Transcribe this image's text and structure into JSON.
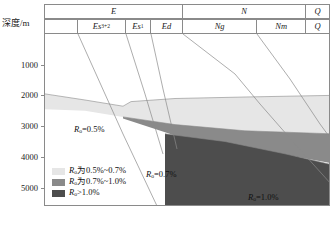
{
  "axis": {
    "depth_label": "深度/m",
    "ticks": [
      {
        "label": "1000",
        "depth": 1000
      },
      {
        "label": "2000",
        "depth": 2000
      },
      {
        "label": "3000",
        "depth": 3000
      },
      {
        "label": "4000",
        "depth": 4000
      },
      {
        "label": "5000",
        "depth": 5000
      }
    ],
    "unit": "m",
    "range": [
      0,
      5600
    ]
  },
  "stratigraphy": {
    "system_row": [
      {
        "label": "E",
        "width_pct": 48.3
      },
      {
        "label": "N",
        "width_pct": 43.0
      },
      {
        "label": "Q",
        "width_pct": 8.7
      }
    ],
    "formation_row": [
      {
        "label": "",
        "sub": "",
        "width_pct": 11.5
      },
      {
        "label": "Es",
        "sub": "3+2",
        "width_pct": 16.8
      },
      {
        "label": "Es",
        "sub": "1",
        "width_pct": 8.7
      },
      {
        "label": "Ed",
        "sub": "",
        "width_pct": 11.3
      },
      {
        "label": "Ng",
        "sub": "",
        "width_pct": 25.9
      },
      {
        "label": "Nm",
        "sub": "",
        "width_pct": 17.1
      },
      {
        "label": "Q",
        "sub": "",
        "width_pct": 8.7
      }
    ]
  },
  "legend": {
    "items": [
      {
        "swatch_color": "#e6e6e6",
        "symbol": "R",
        "sub": "o",
        "text": "为0.5%~0.7%"
      },
      {
        "swatch_color": "#8a8a8a",
        "symbol": "R",
        "sub": "o",
        "text": "为0.7%~1.0%"
      },
      {
        "swatch_color": "#4d4d4d",
        "symbol": "R",
        "sub": "o",
        "text": ">1.0%"
      }
    ]
  },
  "annotations": [
    {
      "id": "ro-05",
      "symbol": "R",
      "sub": "o",
      "text": "=0.5%",
      "x": 74,
      "y": 125
    },
    {
      "id": "ro-07",
      "symbol": "R",
      "sub": "o",
      "text": "=0.7%",
      "x": 146,
      "y": 170
    },
    {
      "id": "ro-10",
      "symbol": "R",
      "sub": "o",
      "text": "=1.0%",
      "x": 248,
      "y": 193
    }
  ],
  "caption": {
    "text": ""
  },
  "colors": {
    "band_low": "#e6e6e6",
    "band_mid": "#8a8a8a",
    "band_high": "#4d4d4d",
    "line": "#8a8a8a",
    "frame": "#8a8a8a",
    "text": "#111111",
    "background": "#ffffff"
  },
  "chart_data": {
    "type": "area",
    "title": "",
    "xlabel": "",
    "ylabel": "深度/m",
    "ylim": [
      0,
      5600
    ],
    "grid": false,
    "legend_position": "lower-left",
    "series": [
      {
        "name": "Ro 0.5%~0.7%",
        "color": "#e6e6e6",
        "top_boundary": [
          [
            0,
            1950
          ],
          [
            40,
            2150
          ],
          [
            78,
            2350
          ],
          [
            86,
            2200
          ],
          [
            130,
            2100
          ],
          [
            200,
            2050
          ],
          [
            286,
            2000
          ]
        ],
        "bottom_boundary": [
          [
            0,
            2450
          ],
          [
            40,
            2500
          ],
          [
            78,
            2700
          ],
          [
            130,
            2950
          ],
          [
            200,
            3150
          ],
          [
            286,
            3250
          ]
        ]
      },
      {
        "name": "Ro 0.7%~1.0%",
        "color": "#8a8a8a",
        "top_boundary": [
          [
            78,
            2700
          ],
          [
            130,
            2950
          ],
          [
            200,
            3150
          ],
          [
            286,
            3250
          ]
        ],
        "bottom_boundary": [
          [
            78,
            2750
          ],
          [
            130,
            3300
          ],
          [
            200,
            3700
          ],
          [
            286,
            4200
          ]
        ]
      },
      {
        "name": "Ro >1.0%",
        "color": "#4d4d4d",
        "top_boundary": [
          [
            120,
            3250
          ],
          [
            180,
            3500
          ],
          [
            240,
            3900
          ],
          [
            286,
            4250
          ]
        ],
        "bottom_boundary": [
          [
            120,
            5600
          ],
          [
            286,
            5600
          ]
        ]
      }
    ],
    "boundary_lines": [
      {
        "name": "Es3+2-line",
        "points": [
          [
            33,
            0
          ],
          [
            78,
            100
          ],
          [
            112,
            172
          ]
        ]
      },
      {
        "name": "Es1-line",
        "points": [
          [
            81,
            0
          ],
          [
            100,
            60
          ],
          [
            118,
            120
          ]
        ]
      },
      {
        "name": "Ed-line",
        "points": [
          [
            106,
            0
          ],
          [
            118,
            55
          ],
          [
            132,
            115
          ]
        ]
      },
      {
        "name": "Ng-line",
        "points": [
          [
            138,
            0
          ],
          [
            190,
            40
          ],
          [
            215,
            70
          ],
          [
            250,
            110
          ],
          [
            286,
            150
          ]
        ]
      },
      {
        "name": "Nm-line",
        "points": [
          [
            212,
            0
          ],
          [
            245,
            45
          ],
          [
            275,
            90
          ],
          [
            286,
            105
          ]
        ]
      }
    ]
  }
}
